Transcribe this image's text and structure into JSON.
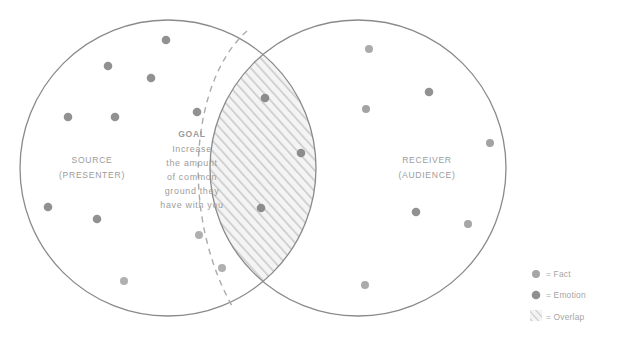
{
  "diagram": {
    "type": "venn",
    "colors": {
      "outline": "#8a8a8a",
      "dashed_arc": "#a7a7a7",
      "dot": "#919191",
      "dot_light": "#a8a8a8",
      "text": "#9c9c9c",
      "hatch_line": "#c9c9c9",
      "hatch_fill": "#f2f2f2",
      "background": "#ffffff"
    },
    "left_circle": {
      "label_line1": "SOURCE",
      "label_line2": "(PRESENTER)",
      "center_x": 168,
      "center_y": 168,
      "radius": 148
    },
    "right_circle": {
      "label_line1": "RECEIVER",
      "label_line2": "(AUDIENCE)",
      "center_x": 358,
      "center_y": 168,
      "radius": 148
    },
    "goal": {
      "title": "GOAL",
      "lines": [
        "Increase",
        "the amount",
        "of common",
        "ground they",
        "have with you"
      ]
    },
    "dots": {
      "left_circle": [
        {
          "x": 166,
          "y": 40,
          "r": 4.3,
          "kind": "emotion"
        },
        {
          "x": 108,
          "y": 66,
          "r": 4.3,
          "kind": "emotion"
        },
        {
          "x": 151,
          "y": 78,
          "r": 4.3,
          "kind": "emotion"
        },
        {
          "x": 68,
          "y": 117,
          "r": 4.3,
          "kind": "emotion"
        },
        {
          "x": 115,
          "y": 117,
          "r": 4.3,
          "kind": "emotion"
        },
        {
          "x": 197,
          "y": 112,
          "r": 4.3,
          "kind": "emotion"
        },
        {
          "x": 48,
          "y": 207,
          "r": 4.3,
          "kind": "emotion"
        },
        {
          "x": 97,
          "y": 219,
          "r": 4.3,
          "kind": "emotion"
        },
        {
          "x": 199,
          "y": 235,
          "r": 4.0,
          "kind": "fact"
        },
        {
          "x": 124,
          "y": 281,
          "r": 4.0,
          "kind": "fact"
        },
        {
          "x": 222,
          "y": 268,
          "r": 4.0,
          "kind": "fact"
        }
      ],
      "overlap": [
        {
          "x": 265,
          "y": 98,
          "r": 4.3,
          "kind": "emotion"
        },
        {
          "x": 301,
          "y": 153,
          "r": 4.3,
          "kind": "emotion"
        },
        {
          "x": 261,
          "y": 208,
          "r": 4.3,
          "kind": "emotion"
        }
      ],
      "right_circle": [
        {
          "x": 369,
          "y": 49,
          "r": 4.0,
          "kind": "fact"
        },
        {
          "x": 429,
          "y": 92,
          "r": 4.3,
          "kind": "emotion"
        },
        {
          "x": 366,
          "y": 109,
          "r": 4.0,
          "kind": "fact"
        },
        {
          "x": 490,
          "y": 143,
          "r": 4.0,
          "kind": "fact"
        },
        {
          "x": 416,
          "y": 212,
          "r": 4.3,
          "kind": "emotion"
        },
        {
          "x": 468,
          "y": 224,
          "r": 4.0,
          "kind": "fact"
        },
        {
          "x": 365,
          "y": 285,
          "r": 4.0,
          "kind": "fact"
        }
      ]
    },
    "legend": {
      "items": [
        {
          "swatch": "fact-dot",
          "label": "= Fact"
        },
        {
          "swatch": "emotion-dot",
          "label": "= Emotion"
        },
        {
          "swatch": "overlap-hatch",
          "label": "= Overlap"
        }
      ]
    }
  }
}
